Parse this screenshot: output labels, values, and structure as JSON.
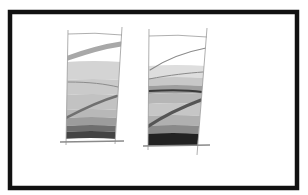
{
  "figure": {
    "frame": {
      "x": 10,
      "y": 12,
      "width": 287,
      "height": 176,
      "stroke": "#111111"
    },
    "panels": [
      {
        "id": "left-blade",
        "outline": {
          "tl": [
            68,
            33
          ],
          "tr": [
            122,
            30
          ],
          "br": [
            115,
            140
          ],
          "bl": [
            66,
            142
          ]
        },
        "top_curve_y": 34,
        "bands": [
          {
            "y0": 62,
            "y1": 80,
            "color": "#d4d4d4"
          },
          {
            "y0": 80,
            "y1": 95,
            "color": "#cacaca"
          },
          {
            "y0": 95,
            "y1": 110,
            "color": "#c2c2c2"
          },
          {
            "y0": 110,
            "y1": 118,
            "color": "#b8b8b8"
          },
          {
            "y0": 118,
            "y1": 126,
            "color": "#9c9c9c"
          },
          {
            "y0": 126,
            "y1": 132,
            "color": "#6e6e6e"
          },
          {
            "y0": 132,
            "y1": 139,
            "color": "#444444"
          }
        ],
        "streaks": [
          {
            "d": "M68,58 C85,52 100,47 121,44",
            "color": "#a8a8a8",
            "width": 5
          },
          {
            "d": "M68,82 C90,82 105,84 118,87",
            "color": "#8c8c8c",
            "width": 1
          },
          {
            "d": "M66,118 C85,108 100,101 117,96",
            "color": "#707070",
            "width": 2.5
          }
        ],
        "base": {
          "x0": 60,
          "x1": 124,
          "y": 142
        }
      },
      {
        "id": "right-blade",
        "outline": {
          "tl": [
            149,
            32
          ],
          "tr": [
            207,
            31
          ],
          "br": [
            197,
            151
          ],
          "bl": [
            148,
            147
          ]
        },
        "top_curve_y": 36,
        "bands": [
          {
            "y0": 66,
            "y1": 78,
            "color": "#dedede"
          },
          {
            "y0": 78,
            "y1": 86,
            "color": "#c8c8c8"
          },
          {
            "y0": 86,
            "y1": 94,
            "color": "#9e9e9e"
          },
          {
            "y0": 94,
            "y1": 104,
            "color": "#b6b6b6"
          },
          {
            "y0": 104,
            "y1": 116,
            "color": "#c6c6c6"
          },
          {
            "y0": 116,
            "y1": 126,
            "color": "#b0b0b0"
          },
          {
            "y0": 126,
            "y1": 134,
            "color": "#8a8a8a"
          },
          {
            "y0": 134,
            "y1": 146,
            "color": "#222222"
          }
        ],
        "streaks": [
          {
            "d": "M150,70 C165,60 185,52 206,48",
            "color": "#8a8a8a",
            "width": 1.2
          },
          {
            "d": "M149,79 C170,75 188,73 203,72",
            "color": "#8a8a8a",
            "width": 1
          },
          {
            "d": "M149,91 C170,90 188,90 202,92",
            "color": "#3a3a3a",
            "width": 2
          },
          {
            "d": "M147,127 C165,115 185,106 201,100",
            "color": "#555555",
            "width": 3
          }
        ],
        "base": {
          "x0": 143,
          "x1": 210,
          "y": 146
        }
      }
    ]
  }
}
